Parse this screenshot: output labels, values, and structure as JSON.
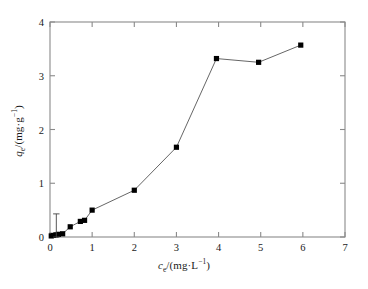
{
  "chart_data": {
    "type": "line",
    "title": "",
    "subtitle": "",
    "xlabel": "c_e/(mg·L^-1)",
    "ylabel": "q_e/(mg·g^-1)",
    "xlabel_parts": {
      "symbol": "c",
      "symbol_sub": "e",
      "unit": "/(mg·L",
      "unit_sup": "-1",
      "unit_close": ")"
    },
    "ylabel_parts": {
      "symbol": "q",
      "symbol_sub": "e",
      "unit": "/(mg·g",
      "unit_sup": "-1",
      "unit_close": ")"
    },
    "xlim": [
      0,
      7
    ],
    "ylim": [
      0,
      4
    ],
    "xticks": [
      0,
      1,
      2,
      3,
      4,
      5,
      6,
      7
    ],
    "yticks": [
      0,
      1,
      2,
      3,
      4
    ],
    "xtick_labels": [
      "0",
      "1",
      "2",
      "3",
      "4",
      "5",
      "6",
      "7"
    ],
    "ytick_labels": [
      "0",
      "1",
      "2",
      "3",
      "4"
    ],
    "grid": false,
    "legend": null,
    "legend_position": "none",
    "marker": "filled-square",
    "marker_color": "#000000",
    "line_color": "#555555",
    "frame_color": "#8a8a8a",
    "background": "#ffffff",
    "series": [
      {
        "name": "adsorption isotherm",
        "x": [
          0.03,
          0.08,
          0.14,
          0.2,
          0.3,
          0.48,
          0.72,
          0.82,
          1.0,
          2.0,
          3.0,
          3.95,
          4.95,
          5.95
        ],
        "y": [
          0.02,
          0.03,
          0.04,
          0.05,
          0.06,
          0.19,
          0.29,
          0.31,
          0.5,
          0.87,
          1.67,
          3.32,
          3.25,
          3.57
        ]
      }
    ],
    "error_bars": [
      {
        "x": 0.15,
        "y": 0.18,
        "yerr_low": 0.18,
        "yerr_high": 0.25
      }
    ]
  },
  "figure": {
    "plot_left_px": 50,
    "plot_right_px": 345,
    "plot_top_px": 22,
    "plot_bottom_px": 237
  }
}
